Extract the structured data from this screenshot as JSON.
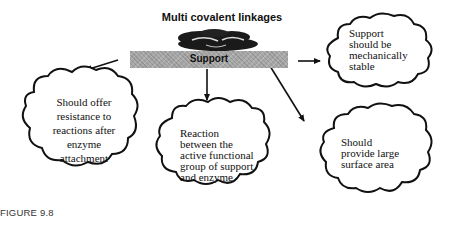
{
  "diagram": {
    "title": "Multi covalent linkages",
    "support_label": "Support",
    "clouds": [
      {
        "id": "mechanically-stable",
        "text": "Support should be mechanically stable",
        "lines": [
          "Support",
          "should be",
          "mechanically",
          "stable"
        ]
      },
      {
        "id": "resistance",
        "text": "Should offer resistance to reactions after enzyme attachment",
        "lines": [
          "Should offer",
          "resistance to",
          "reactions after",
          "enzyme",
          "attachment"
        ]
      },
      {
        "id": "reaction",
        "text": "Reaction between the active functional group of support and enzyme",
        "lines": [
          "Reaction",
          "between the",
          "active functional",
          "group of support",
          "and enzyme"
        ]
      },
      {
        "id": "surface-area",
        "text": "Should provide large surface area",
        "lines": [
          "Should",
          "provide large",
          "surface area"
        ]
      }
    ],
    "arrows": [
      {
        "from": "support",
        "to": "mechanically-stable",
        "direction": "right"
      },
      {
        "from": "support",
        "to": "resistance",
        "direction": "down-left"
      },
      {
        "from": "support",
        "to": "reaction",
        "direction": "down"
      },
      {
        "from": "support",
        "to": "surface-area",
        "direction": "down-right"
      }
    ],
    "colors": {
      "stroke": "#111111",
      "support_fill": "#a8a8a8",
      "blob": "#1a1a1a"
    }
  },
  "caption": {
    "label": "FIGURE 9.8"
  }
}
